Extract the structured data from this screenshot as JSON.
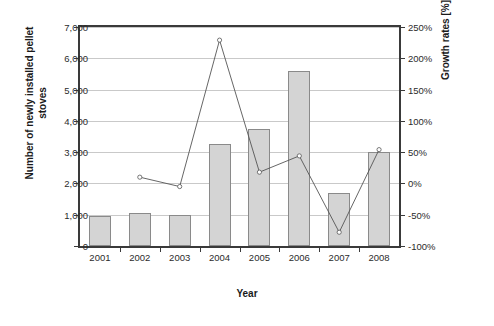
{
  "chart_data": {
    "type": "bar",
    "title": "",
    "xlabel": "Year",
    "categories": [
      "2001",
      "2002",
      "2003",
      "2004",
      "2005",
      "2006",
      "2007",
      "2008"
    ],
    "series": [
      {
        "name": "Number of newly installed pellet stoves",
        "type": "bar",
        "axis": "left",
        "values": [
          950,
          1050,
          1000,
          3250,
          3750,
          5600,
          1700,
          3000
        ]
      },
      {
        "name": "Growth rates [%]",
        "type": "line",
        "axis": "right",
        "values": [
          null,
          10,
          -5,
          229,
          18,
          44,
          -78,
          54
        ]
      }
    ],
    "left_axis": {
      "label": "Number of newly installed pellet stoves",
      "ticks": [
        "0",
        "1,000",
        "2,000",
        "3,000",
        "4,000",
        "5,000",
        "6,000",
        "7,000"
      ],
      "values": [
        0,
        1000,
        2000,
        3000,
        4000,
        5000,
        6000,
        7000
      ],
      "ylim": [
        0,
        7000
      ]
    },
    "right_axis": {
      "label": "Growth rates [%]",
      "ticks": [
        "-100%",
        "-50%",
        "0%",
        "50%",
        "100%",
        "150%",
        "200%",
        "250%"
      ],
      "values": [
        -100,
        -50,
        0,
        50,
        100,
        150,
        200,
        250
      ],
      "ylim": [
        -100,
        250
      ]
    },
    "grid": true,
    "legend": "none",
    "colors": {
      "bar_fill": "#d4d4d4",
      "bar_edge": "#8a8a8a",
      "line": "#555555",
      "grid": "#c9c9c9",
      "axis": "#3a3a3a"
    }
  }
}
